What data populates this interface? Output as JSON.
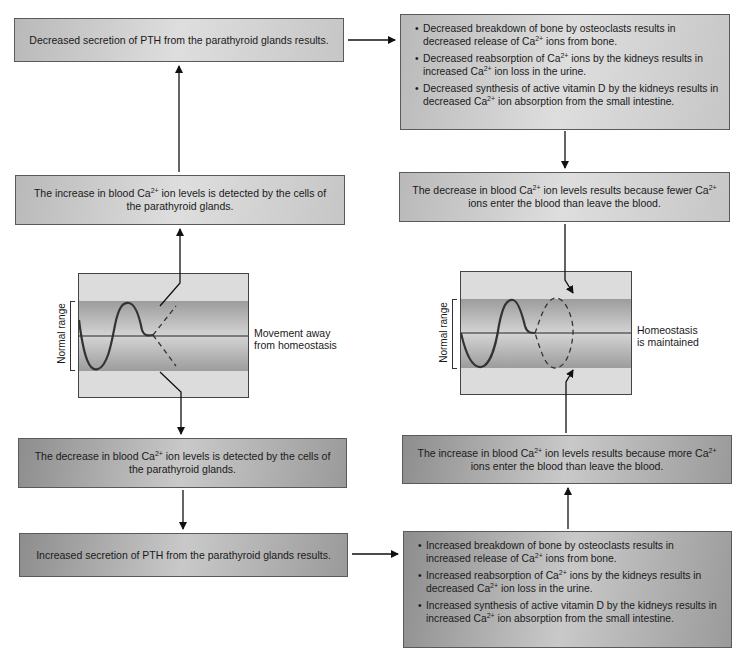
{
  "boxes": {
    "top_left": "Decreased secretion of PTH from the parathyroid glands results.",
    "top_right": [
      {
        "pre": "Decreased breakdown of bone by osteoclasts results in decreased release of Ca",
        "sup": "2+",
        "post": " ions from bone."
      },
      {
        "pre": "Decreased reabsorption of Ca",
        "sup": "2+",
        "mid": " ions by the kidneys results in increased Ca",
        "sup2": "2+",
        "post": " ion loss in the urine."
      },
      {
        "pre": "Decreased synthesis of active vitamin D by the kidneys results in decreased Ca",
        "sup": "2+",
        "post": " ion absorption from the small intestine."
      }
    ],
    "mid_left": {
      "pre": "The increase in blood Ca",
      "sup": "2+",
      "post": " ion levels is detected by the cells of the parathyroid glands."
    },
    "mid_right": {
      "pre": "The decrease in blood Ca",
      "sup": "2+",
      "mid": " ion levels results because fewer Ca",
      "sup2": "2+",
      "post": " ions enter the blood than leave the blood."
    },
    "lower_left": {
      "pre": "The decrease in blood Ca",
      "sup": "2+",
      "post": " ion levels is detected by the cells of the parathyroid glands."
    },
    "lower_right": {
      "pre": "The increase in blood Ca",
      "sup": "2+",
      "mid": " ion levels results because more Ca",
      "sup2": "2+",
      "post": " ions enter the blood than leave the blood."
    },
    "bottom_left": "Increased secretion of PTH from the parathyroid glands results.",
    "bottom_right": [
      {
        "pre": "Increased breakdown of bone by osteoclasts results in increased release of Ca",
        "sup": "2+",
        "post": " ions from bone."
      },
      {
        "pre": "Increased reabsorption of Ca",
        "sup": "2+",
        "mid": " ions by the kidneys results in decreased Ca",
        "sup2": "2+",
        "post": " ion loss in the urine."
      },
      {
        "pre": "Increased synthesis of active vitamin D by the kidneys results in increased Ca",
        "sup": "2+",
        "post": " ion absorption from the small intestine."
      }
    ]
  },
  "graphs": {
    "left": {
      "axis_label": "Normal range",
      "caption_line1": "Movement away",
      "caption_line2": "from homeostasis"
    },
    "right": {
      "axis_label": "Normal range",
      "caption_line1": "Homeostasis",
      "caption_line2": "is maintained"
    }
  },
  "colors": {
    "box_border": "#5a5a5a",
    "arrow": "#111111",
    "band": "#9c9c9c",
    "graph_bg": "#dcdcdc"
  }
}
